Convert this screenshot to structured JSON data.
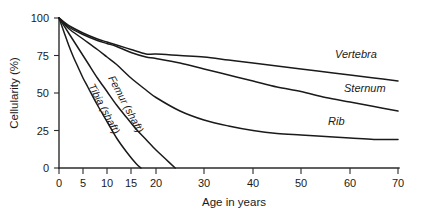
{
  "chart_data": {
    "type": "line",
    "title": "",
    "subtitle": "",
    "xlabel": "Age in years",
    "ylabel": "Cellularity (%)",
    "xlim": [
      0,
      70
    ],
    "ylim": [
      0,
      100
    ],
    "xticks": [
      0,
      5,
      10,
      15,
      20,
      30,
      40,
      50,
      60,
      70
    ],
    "xtick_labels": [
      "0",
      "5",
      "10",
      "15",
      "20",
      "30",
      "40",
      "50",
      "60",
      "70"
    ],
    "yticks": [
      0,
      25,
      50,
      75,
      100
    ],
    "ytick_labels": [
      "0",
      "25",
      "50",
      "75",
      "100"
    ],
    "grid": false,
    "legend_position": "inline-right",
    "x_axis_scale_note": "Minor 5-year ticks from 0 to 20, then 10-year ticks to 70; spacing is uniform per tick",
    "series": [
      {
        "name": "Vertebra",
        "label": "Vertebra",
        "label_position": "right-inline",
        "x": [
          0,
          2,
          5,
          8,
          10,
          12,
          15,
          18,
          20,
          25,
          30,
          35,
          40,
          45,
          50,
          55,
          60,
          65,
          70
        ],
        "values": [
          100,
          95,
          90,
          86,
          84,
          82,
          79,
          76,
          76,
          75,
          74,
          72,
          70,
          68,
          66,
          64,
          62,
          60,
          58
        ]
      },
      {
        "name": "Sternum",
        "label": "Sternum",
        "label_position": "right-inline",
        "x": [
          0,
          2,
          5,
          8,
          10,
          12,
          15,
          18,
          20,
          25,
          30,
          35,
          40,
          45,
          50,
          55,
          60,
          65,
          70
        ],
        "values": [
          100,
          94,
          89,
          85,
          83,
          81,
          77,
          74,
          73,
          70,
          66,
          62,
          58,
          54,
          51,
          47,
          44,
          41,
          38
        ]
      },
      {
        "name": "Rib",
        "label": "Rib",
        "label_position": "right-inline",
        "x": [
          0,
          2,
          5,
          8,
          10,
          12,
          15,
          18,
          20,
          25,
          30,
          35,
          40,
          45,
          50,
          55,
          60,
          65,
          70
        ],
        "values": [
          100,
          93,
          86,
          79,
          74,
          69,
          60,
          52,
          47,
          38,
          32,
          28,
          25,
          23,
          22,
          21,
          20,
          19,
          19
        ]
      },
      {
        "name": "Femur (shaft)",
        "label": "Femur (shaft)",
        "label_position": "rotated-along-curve",
        "x": [
          0,
          2,
          4,
          6,
          8,
          10,
          12,
          14,
          16,
          18,
          20,
          22,
          24
        ],
        "values": [
          100,
          90,
          80,
          70,
          60,
          51,
          42,
          34,
          26,
          19,
          12,
          6,
          0
        ]
      },
      {
        "name": "Tibia (shaft)",
        "label": "Tibia (shaft)",
        "label_position": "rotated-along-curve",
        "x": [
          0,
          1,
          2,
          3,
          4,
          5,
          6,
          8,
          10,
          12,
          14,
          16,
          17
        ],
        "values": [
          100,
          91,
          82,
          74,
          67,
          60,
          54,
          42,
          31,
          20,
          11,
          3,
          0
        ]
      }
    ]
  },
  "axes": {
    "y_title": "Cellularity (%)",
    "x_title": "Age in years"
  },
  "labels": {
    "vertebra": "Vertebra",
    "sternum": "Sternum",
    "rib": "Rib",
    "femur": "Femur (shaft)",
    "tibia": "Tibia (shaft)"
  },
  "colors": {
    "line": "#1a1a1a",
    "axis": "#2b2b2b",
    "background": "#ffffff",
    "text": "#1a1a1a"
  }
}
